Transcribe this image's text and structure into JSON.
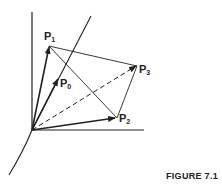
{
  "figure": {
    "caption": "FIGURE 7.1",
    "points": {
      "P0": {
        "label": "P",
        "sub": "0"
      },
      "P1": {
        "label": "P",
        "sub": "1"
      },
      "P2": {
        "label": "P",
        "sub": "2"
      },
      "P3": {
        "label": "P",
        "sub": "3"
      }
    },
    "colors": {
      "ink": "#222222",
      "background": "#ffffff"
    }
  }
}
